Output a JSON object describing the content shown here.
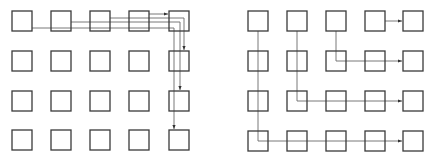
{
  "diagram": {
    "colors": {
      "box_stroke": "#3a3a3a",
      "wire": "#6a6a6a",
      "arrow": "#333333"
    },
    "box_size": 20,
    "left_grid": {
      "cols_x": [
        12,
        51,
        90,
        129,
        169
      ],
      "rows_y": [
        11,
        51,
        91,
        130
      ],
      "paths": [
        {
          "from": "r0c3",
          "to": "r0c4",
          "points": "149,14 168,14"
        },
        {
          "from": "r0c2",
          "to": "r1c4",
          "points": "110,18 184,18 184,50"
        },
        {
          "from": "r0c1",
          "to": "r2c4",
          "points": "71,22 180,22 180,90"
        },
        {
          "from": "r0c0",
          "to": "r3c4",
          "points": "32,28 174,28 174,129"
        }
      ]
    },
    "right_grid": {
      "cols_x": [
        248,
        287,
        326,
        365,
        403
      ],
      "rows_y": [
        11,
        51,
        91,
        131
      ],
      "paths": [
        {
          "from": "r0c3",
          "to": "r0c4",
          "points": "385,21 402,21"
        },
        {
          "from": "r0c2",
          "to": "r1c4",
          "points": "336,31 336,61 402,61"
        },
        {
          "from": "r0c1",
          "to": "r2c4",
          "points": "297,31 297,101 402,101"
        },
        {
          "from": "r0c0",
          "to": "r3c4",
          "points": "258,31 258,141 402,141"
        }
      ]
    }
  }
}
